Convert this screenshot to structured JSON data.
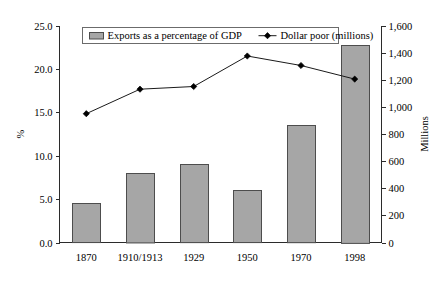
{
  "chart_data": {
    "type": "bar",
    "title": "",
    "categories": [
      "1870",
      "1910/1913",
      "1929",
      "1950",
      "1970",
      "1998"
    ],
    "series": [
      {
        "name": "Exports as a percentage of GDP",
        "type": "bar",
        "axis": "left",
        "values": [
          4.5,
          8.0,
          9.0,
          6.0,
          13.5,
          22.8
        ]
      },
      {
        "name": "Dollar poor (millions)",
        "type": "line",
        "axis": "right",
        "values": [
          950,
          1130,
          1150,
          1375,
          1305,
          1205
        ]
      }
    ],
    "xlabel": "",
    "ylabel": "%",
    "y2label": "Millions",
    "ylim": [
      0,
      25
    ],
    "y2lim": [
      0,
      1600
    ],
    "yticks": [
      "0.0",
      "5.0",
      "10.0",
      "15.0",
      "20.0",
      "25.0"
    ],
    "ytick_values": [
      0,
      5,
      10,
      15,
      20,
      25
    ],
    "y2ticks": [
      "0",
      "200",
      "400",
      "600",
      "800",
      "1,000",
      "1,200",
      "1,400",
      "1,600"
    ],
    "y2tick_values": [
      0,
      200,
      400,
      600,
      800,
      1000,
      1200,
      1400,
      1600
    ],
    "grid": false,
    "legend_position": "top-center",
    "legend_entries": [
      {
        "label": "Exports as a percentage of GDP",
        "marker": "bar-swatch",
        "color": "#a6a6a6"
      },
      {
        "label": "Dollar poor (millions)",
        "marker": "line-diamond",
        "color": "#000000"
      }
    ],
    "colors": {
      "bar_fill": "#a6a6a6",
      "bar_stroke": "#4d4d4d",
      "line": "#1a1a1a",
      "marker": "#000000",
      "axis": "#2b2b2b",
      "background": "#ffffff"
    }
  }
}
